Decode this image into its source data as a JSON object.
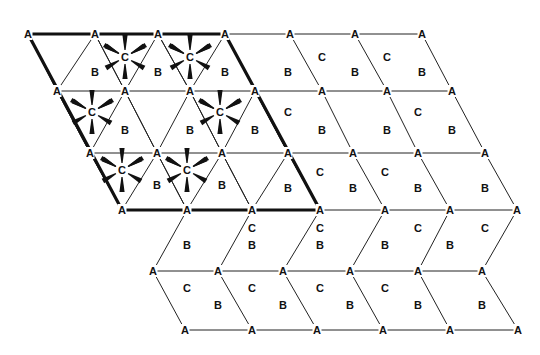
{
  "diagram": {
    "title": "",
    "colors": {
      "line": "#222222",
      "label": "#111111",
      "background": "#ffffff"
    },
    "node_rows": [
      {
        "y": 34,
        "x": [
          28,
          95,
          158,
          225,
          290,
          355,
          422
        ]
      },
      {
        "y": 91,
        "x": [
          57,
          125,
          190,
          255,
          322,
          387,
          452
        ]
      },
      {
        "y": 153,
        "x": [
          90,
          157,
          222,
          288,
          353,
          418,
          485
        ]
      },
      {
        "y": 210,
        "x": [
          122,
          187,
          252,
          320,
          385,
          450,
          517
        ]
      },
      {
        "y": 271,
        "x": [
          153,
          218,
          283,
          350,
          418,
          482
        ]
      },
      {
        "y": 330,
        "x": [
          185,
          252,
          317,
          383,
          450,
          518
        ]
      }
    ],
    "node_label": "A",
    "thick_outline": [
      [
        28,
        34
      ],
      [
        225,
        34
      ],
      [
        320,
        210
      ],
      [
        122,
        210
      ],
      [
        28,
        34
      ]
    ],
    "triangle_region": {
      "note": "thin diagonals subdividing the outlined parallelogram into triangles",
      "diagonals": [
        [
          [
            95,
            34
          ],
          [
            57,
            91
          ]
        ],
        [
          [
            158,
            34
          ],
          [
            125,
            91
          ]
        ],
        [
          [
            225,
            34
          ],
          [
            190,
            91
          ]
        ],
        [
          [
            57,
            91
          ],
          [
            90,
            153
          ]
        ],
        [
          [
            125,
            91
          ],
          [
            157,
            153
          ]
        ],
        [
          [
            190,
            91
          ],
          [
            222,
            153
          ]
        ],
        [
          [
            255,
            91
          ],
          [
            288,
            153
          ]
        ],
        [
          [
            95,
            34
          ],
          [
            125,
            91
          ]
        ],
        [
          [
            158,
            34
          ],
          [
            190,
            91
          ]
        ],
        [
          [
            125,
            91
          ],
          [
            90,
            153
          ]
        ],
        [
          [
            190,
            91
          ],
          [
            157,
            153
          ]
        ],
        [
          [
            255,
            91
          ],
          [
            222,
            153
          ]
        ],
        [
          [
            90,
            153
          ],
          [
            122,
            210
          ]
        ],
        [
          [
            157,
            153
          ],
          [
            187,
            210
          ]
        ],
        [
          [
            222,
            153
          ],
          [
            252,
            210
          ]
        ],
        [
          [
            288,
            153
          ],
          [
            320,
            210
          ]
        ],
        [
          [
            157,
            153
          ],
          [
            122,
            210
          ]
        ],
        [
          [
            222,
            153
          ],
          [
            187,
            210
          ]
        ],
        [
          [
            288,
            153
          ],
          [
            252,
            210
          ]
        ]
      ]
    },
    "b_labels": [
      [
        95,
        72
      ],
      [
        158,
        72
      ],
      [
        225,
        72
      ],
      [
        125,
        130
      ],
      [
        190,
        130
      ],
      [
        255,
        130
      ],
      [
        157,
        185
      ],
      [
        222,
        185
      ],
      [
        288,
        72
      ],
      [
        355,
        72
      ],
      [
        422,
        72
      ],
      [
        322,
        130
      ],
      [
        387,
        130
      ],
      [
        452,
        130
      ],
      [
        288,
        188
      ],
      [
        353,
        188
      ],
      [
        418,
        188
      ],
      [
        485,
        188
      ],
      [
        187,
        245
      ],
      [
        252,
        245
      ],
      [
        320,
        245
      ],
      [
        385,
        245
      ],
      [
        450,
        245
      ],
      [
        218,
        305
      ],
      [
        283,
        305
      ],
      [
        350,
        305
      ],
      [
        418,
        305
      ],
      [
        482,
        305
      ]
    ],
    "c_labels": [
      [
        125,
        57
      ],
      [
        190,
        57
      ],
      [
        92,
        112
      ],
      [
        220,
        112
      ],
      [
        122,
        170
      ],
      [
        187,
        170
      ],
      [
        322,
        57
      ],
      [
        387,
        57
      ],
      [
        288,
        112
      ],
      [
        418,
        112
      ],
      [
        320,
        172
      ],
      [
        385,
        172
      ],
      [
        252,
        228
      ],
      [
        320,
        228
      ],
      [
        418,
        228
      ],
      [
        485,
        228
      ],
      [
        187,
        288
      ],
      [
        252,
        288
      ],
      [
        320,
        288
      ],
      [
        385,
        288
      ]
    ],
    "b_text": "B",
    "c_text": "C",
    "octahedral_centers": [
      [
        125,
        57
      ],
      [
        190,
        57
      ],
      [
        92,
        112
      ],
      [
        220,
        112
      ],
      [
        122,
        170
      ],
      [
        187,
        170
      ]
    ]
  }
}
